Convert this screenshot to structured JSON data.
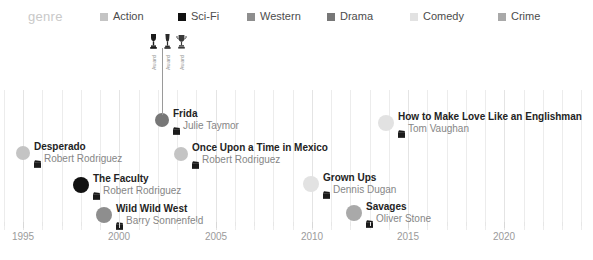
{
  "legend": {
    "title": "genre",
    "items": [
      {
        "label": "Action",
        "color": "#c4c4c4"
      },
      {
        "label": "Sci-Fi",
        "color": "#111111"
      },
      {
        "label": "Western",
        "color": "#8e8e8e"
      },
      {
        "label": "Drama",
        "color": "#777777"
      },
      {
        "label": "Comedy",
        "color": "#e2e2e2"
      },
      {
        "label": "Crime",
        "color": "#a9a9a9"
      }
    ]
  },
  "axis": {
    "ticks": [
      {
        "label": "1995",
        "year": 1995
      },
      {
        "label": "2000",
        "year": 2000
      },
      {
        "label": "2005",
        "year": 2005
      },
      {
        "label": "2010",
        "year": 2010
      },
      {
        "label": "2015",
        "year": 2015
      },
      {
        "label": "2020",
        "year": 2020
      }
    ],
    "min_year": 1994,
    "max_year": 2024
  },
  "awards": {
    "captions": [
      "Award",
      "Award",
      "Award"
    ],
    "icon": "trophy-icon",
    "count": 3
  },
  "chart_data": {
    "type": "scatter",
    "title": "genre",
    "xlabel": "",
    "ylabel": "",
    "xlim": [
      1994,
      2024
    ],
    "grid": true,
    "legend_position": "top",
    "movies": [
      {
        "title": "Desperado",
        "director": "Robert Rodriguez",
        "genre": "Action",
        "color": "#c4c4c4",
        "year": 1995,
        "x": 23,
        "y": 148,
        "r": 7,
        "awards": 0
      },
      {
        "title": "The Faculty",
        "director": "Robert Rodriguez",
        "genre": "Sci-Fi",
        "color": "#111111",
        "year": 1998,
        "x": 81,
        "y": 181,
        "r": 8,
        "awards": 0
      },
      {
        "title": "Wild Wild West",
        "director": "Barry Sonnenfeld",
        "genre": "Western",
        "color": "#8e8e8e",
        "year": 1999,
        "x": 104,
        "y": 211,
        "r": 8,
        "awards": 0
      },
      {
        "title": "Frida",
        "director": "Julie Taymor",
        "genre": "Drama",
        "color": "#777777",
        "year": 2002,
        "x": 162,
        "y": 115,
        "r": 7,
        "awards": 3
      },
      {
        "title": "Once Upon a Time in Mexico",
        "director": "Robert Rodriguez",
        "genre": "Action",
        "color": "#c4c4c4",
        "year": 2003,
        "x": 181,
        "y": 149,
        "r": 7,
        "awards": 0
      },
      {
        "title": "Grown Ups",
        "director": "Dennis Dugan",
        "genre": "Comedy",
        "color": "#e2e2e2",
        "year": 2010,
        "x": 311,
        "y": 180,
        "r": 8,
        "awards": 0
      },
      {
        "title": "Savages",
        "director": "Oliver Stone",
        "genre": "Crime",
        "color": "#a9a9a9",
        "year": 2012,
        "x": 354,
        "y": 209,
        "r": 8,
        "awards": 0
      },
      {
        "title": "How to Make Love Like an Englishman",
        "director": "Tom Vaughan",
        "genre": "Comedy",
        "color": "#e2e2e2",
        "year": 2014,
        "x": 386,
        "y": 119,
        "r": 8,
        "awards": 0
      }
    ]
  }
}
